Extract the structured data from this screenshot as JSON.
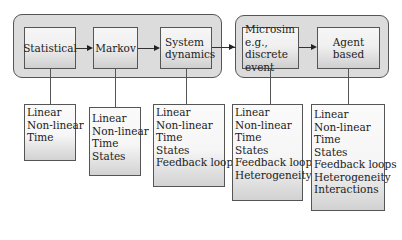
{
  "diagram": {
    "groups": [
      {
        "id": "group-1",
        "members": [
          "Statistical",
          "Markov",
          "System dynamics"
        ]
      },
      {
        "id": "group-2",
        "members": [
          "Microsim e.g., discrete event",
          "Agent based"
        ]
      }
    ],
    "nodes": [
      {
        "label_lines": [
          "Statistical"
        ]
      },
      {
        "label_lines": [
          "Markov"
        ]
      },
      {
        "label_lines": [
          "System",
          "dynamics"
        ]
      },
      {
        "label_lines": [
          "Microsim",
          "e.g., discrete",
          "event"
        ]
      },
      {
        "label_lines": [
          "Agent based"
        ]
      }
    ],
    "attributes": [
      {
        "items": [
          "Linear",
          "Non-linear",
          "Time"
        ]
      },
      {
        "items": [
          "Linear",
          "Non-linear",
          "Time",
          "States"
        ]
      },
      {
        "items": [
          "Linear",
          "Non-linear",
          "Time",
          "States",
          "Feedback loops"
        ]
      },
      {
        "items": [
          "Linear",
          "Non-linear",
          "Time",
          "States",
          "Feedback loops",
          "Heterogeneity"
        ]
      },
      {
        "items": [
          "Linear",
          "Non-linear",
          "Time",
          "States",
          "Feedback loops",
          "Heterogeneity",
          "Interactions"
        ]
      }
    ],
    "edges": [
      {
        "from": "Statistical",
        "to": "Markov"
      },
      {
        "from": "Markov",
        "to": "System dynamics"
      },
      {
        "from": "System dynamics",
        "to": "Microsim e.g., discrete event"
      },
      {
        "from": "Microsim e.g., discrete event",
        "to": "Agent based"
      }
    ]
  }
}
